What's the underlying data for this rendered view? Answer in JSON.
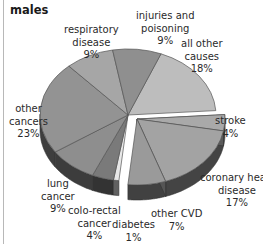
{
  "chart_data": {
    "type": "pie",
    "title": "males",
    "style": "3d-exploded",
    "unit": "%",
    "slices": [
      {
        "label": "all other causes",
        "value": 18,
        "color": "#bdbdbd",
        "exploded": false
      },
      {
        "label": "stroke",
        "value": 4,
        "color": "#a9a9a9",
        "exploded": true
      },
      {
        "label": "coronary heart disease",
        "value": 17,
        "color": "#a3a3a3",
        "exploded": true
      },
      {
        "label": "other CVD",
        "value": 7,
        "color": "#9a9a9a",
        "exploded": true
      },
      {
        "label": "diabetes",
        "value": 1,
        "color": "#e8e8e8",
        "exploded": false
      },
      {
        "label": "colo-rectal cancer",
        "value": 4,
        "color": "#7a7a7a",
        "exploded": false
      },
      {
        "label": "lung cancer",
        "value": 9,
        "color": "#8e8e8e",
        "exploded": false
      },
      {
        "label": "other cancers",
        "value": 23,
        "color": "#939393",
        "exploded": false
      },
      {
        "label": "respiratory disease",
        "value": 9,
        "color": "#a6a6a6",
        "exploded": false
      },
      {
        "label": "injuries and poisoning",
        "value": 9,
        "color": "#8f8f8f",
        "exploded": false
      }
    ]
  },
  "labels": {
    "title": "males",
    "respiratory": [
      "respiratory",
      "disease",
      "9%"
    ],
    "injuries": [
      "injuries and",
      "poisoning",
      "9%"
    ],
    "allother": [
      "all other",
      "causes",
      "18%"
    ],
    "stroke": [
      "stroke",
      "4%"
    ],
    "chd": [
      "coronary heart",
      "disease",
      "17%"
    ],
    "othercvd": [
      "other CVD",
      "7%"
    ],
    "diabetes": [
      "diabetes",
      "1%"
    ],
    "colorectal": [
      "colo-rectal",
      "cancer",
      "4%"
    ],
    "lung": [
      "lung",
      "cancer",
      "9%"
    ],
    "othercancers": [
      "other",
      "cancers",
      "23%"
    ]
  }
}
